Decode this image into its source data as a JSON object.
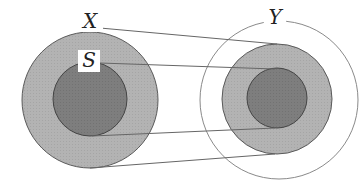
{
  "diagram": {
    "type": "set-mapping",
    "colors": {
      "background": "#ffffff",
      "outer_fill": "#b3b3b3",
      "inner_fill": "#7e7e7e",
      "stroke": "#555555",
      "line": "#666666",
      "y_circle_stroke": "#8a8a8a"
    },
    "left": {
      "outer": {
        "label": "X",
        "cx": 90,
        "cy": 100,
        "r": 68
      },
      "inner": {
        "label": "S",
        "cx": 90,
        "cy": 99,
        "r": 37
      }
    },
    "right": {
      "codomain": {
        "label": "Y",
        "cx": 279,
        "cy": 100,
        "r": 79
      },
      "image_outer": {
        "cx": 277,
        "cy": 99,
        "r": 55
      },
      "image_inner": {
        "cx": 277,
        "cy": 98,
        "r": 30
      }
    },
    "lines": [
      {
        "x1": 100,
        "y1": 28,
        "x2": 277,
        "y2": 44
      },
      {
        "x1": 100,
        "y1": 63,
        "x2": 275,
        "y2": 69
      },
      {
        "x1": 92,
        "y1": 136,
        "x2": 275,
        "y2": 128
      },
      {
        "x1": 90,
        "y1": 168,
        "x2": 275,
        "y2": 154
      }
    ],
    "labels": {
      "x": "X",
      "s": "S",
      "y": "Y"
    }
  }
}
